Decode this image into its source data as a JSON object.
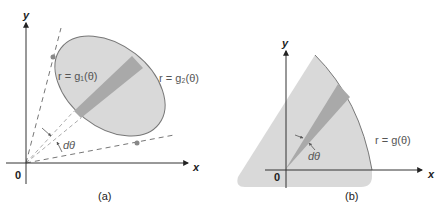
{
  "figure": {
    "colors": {
      "region_fill": "#d9d9d9",
      "strip_fill": "#a9a9a9",
      "outline": "#777777",
      "axis": "#333333",
      "dash": "#666666",
      "point": "#888888",
      "label": "#555555"
    },
    "panel_a": {
      "caption": "(a)",
      "axis_x": "x",
      "axis_y": "y",
      "origin": "0",
      "inner_curve_label": "r = g₁(θ)",
      "outer_curve_label": "r = g₂(θ)",
      "angle_label": "dθ"
    },
    "panel_b": {
      "caption": "(b)",
      "axis_x": "x",
      "axis_y": "y",
      "origin": "0",
      "curve_label": "r = g(θ)",
      "angle_label": "dθ"
    }
  }
}
